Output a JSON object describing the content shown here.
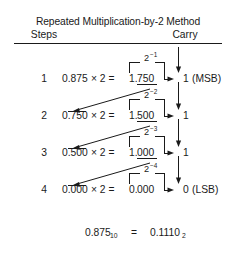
{
  "header": {
    "title": "Repeated Multiplication-by-2 Method",
    "col_steps": "Steps",
    "col_carry": "Carry"
  },
  "rows": [
    {
      "step": "1",
      "operand": "0.875",
      "times": "× 2 =",
      "result_int": "1.",
      "result_frac": "750",
      "weight_base": "2",
      "weight_exp": "−1",
      "carry": "1",
      "tag": "(MSB)"
    },
    {
      "step": "2",
      "operand": "0.750",
      "times": "× 2 =",
      "result_int": "1.",
      "result_frac": "500",
      "weight_base": "2",
      "weight_exp": "−2",
      "carry": "1",
      "tag": ""
    },
    {
      "step": "3",
      "operand": "0.500",
      "times": "× 2 =",
      "result_int": "1.",
      "result_frac": "000",
      "weight_base": "2",
      "weight_exp": "−3",
      "carry": "1",
      "tag": ""
    },
    {
      "step": "4",
      "operand": "0.000",
      "times": "× 2 =",
      "result_int": "0.",
      "result_frac": "000",
      "weight_base": "2",
      "weight_exp": "−4",
      "carry": "0",
      "tag": "(LSB)"
    }
  ],
  "summary": {
    "decimal_value": "0.875",
    "decimal_sub": "10",
    "equals": "=",
    "binary_value": "0.1110",
    "binary_sub": "2"
  },
  "colors": {
    "ink": "#1a1a1a",
    "background": "#ffffff"
  }
}
